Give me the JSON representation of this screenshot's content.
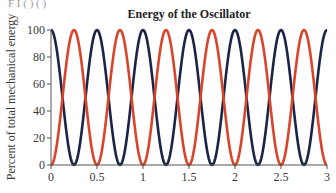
{
  "header_fragment": "F I ( ) ( )",
  "chart_data": {
    "type": "line",
    "title": "Energy of the Oscillator",
    "xlabel": "",
    "ylabel": "Percent of total mechanical energy",
    "xlim": [
      0,
      3
    ],
    "ylim": [
      0,
      100
    ],
    "x_ticks": [
      0,
      0.5,
      1,
      1.5,
      2,
      2.5,
      3
    ],
    "x_tick_labels": [
      "0",
      "0.5",
      "1",
      "1.5",
      "2",
      "2.5",
      "3"
    ],
    "y_ticks": [
      0,
      20,
      40,
      60,
      80,
      100
    ],
    "y_tick_labels": [
      "0",
      "20",
      "40",
      "60",
      "80",
      "100"
    ],
    "grid": false,
    "legend": null,
    "series": [
      {
        "name": "dark curve (starts at 100%)",
        "color": "#1b2447",
        "formula": "100*cos^2(2*pi*t)",
        "x": [
          0,
          0.125,
          0.25,
          0.375,
          0.5,
          0.625,
          0.75,
          0.875,
          1,
          1.125,
          1.25,
          1.375,
          1.5,
          1.625,
          1.75,
          1.875,
          2,
          2.125,
          2.25,
          2.375,
          2.5,
          2.625,
          2.75,
          2.875,
          3
        ],
        "values": [
          100,
          50,
          0,
          50,
          100,
          50,
          0,
          50,
          100,
          50,
          0,
          50,
          100,
          50,
          0,
          50,
          100,
          50,
          0,
          50,
          100,
          50,
          0,
          50,
          100
        ]
      },
      {
        "name": "red curve (starts at 0%)",
        "color": "#d9452a",
        "formula": "100*sin^2(2*pi*t)",
        "x": [
          0,
          0.125,
          0.25,
          0.375,
          0.5,
          0.625,
          0.75,
          0.875,
          1,
          1.125,
          1.25,
          1.375,
          1.5,
          1.625,
          1.75,
          1.875,
          2,
          2.125,
          2.25,
          2.375,
          2.5,
          2.625,
          2.75,
          2.875,
          3
        ],
        "values": [
          0,
          50,
          100,
          50,
          0,
          50,
          100,
          50,
          0,
          50,
          100,
          50,
          0,
          50,
          100,
          50,
          0,
          50,
          100,
          50,
          0,
          50,
          100,
          50,
          0
        ]
      }
    ]
  },
  "layout": {
    "plot_left": 51,
    "plot_right": 327,
    "plot_top": 30,
    "plot_bottom": 165
  }
}
